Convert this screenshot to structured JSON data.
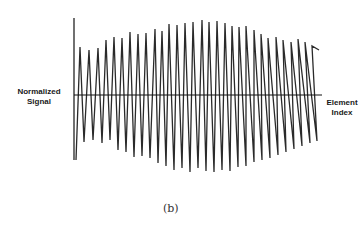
{
  "chart_data": {
    "type": "line",
    "title": "",
    "xlabel": "Element Index",
    "ylabel": "Normalized Signal",
    "caption": "(b)",
    "grid": false,
    "legend": null,
    "axis_origin_px": {
      "x": 74,
      "y": 95
    },
    "peaks_px": [
      [
        80,
        47
      ],
      [
        89,
        50
      ],
      [
        98,
        48
      ],
      [
        106,
        40
      ],
      [
        114,
        37
      ],
      [
        122,
        38
      ],
      [
        130,
        32
      ],
      [
        138,
        34
      ],
      [
        146,
        33
      ],
      [
        155,
        29
      ],
      [
        162,
        31
      ],
      [
        169,
        24
      ],
      [
        177,
        25
      ],
      [
        185,
        23
      ],
      [
        193,
        22
      ],
      [
        202,
        20
      ],
      [
        209,
        22
      ],
      [
        217,
        21
      ],
      [
        225,
        23
      ],
      [
        232,
        26
      ],
      [
        239,
        27
      ],
      [
        246,
        26
      ],
      [
        254,
        30
      ],
      [
        261,
        34
      ],
      [
        268,
        38
      ],
      [
        276,
        37
      ],
      [
        283,
        40
      ],
      [
        291,
        42
      ],
      [
        298,
        39
      ],
      [
        305,
        42
      ],
      [
        312,
        46
      ],
      [
        319,
        50
      ]
    ],
    "troughs_px": [
      [
        76,
        160
      ],
      [
        84,
        142
      ],
      [
        93,
        140
      ],
      [
        102,
        143
      ],
      [
        110,
        140
      ],
      [
        118,
        150
      ],
      [
        126,
        152
      ],
      [
        134,
        157
      ],
      [
        142,
        156
      ],
      [
        150,
        158
      ],
      [
        158,
        163
      ],
      [
        166,
        166
      ],
      [
        174,
        170
      ],
      [
        182,
        168
      ],
      [
        190,
        172
      ],
      [
        198,
        168
      ],
      [
        206,
        171
      ],
      [
        214,
        172
      ],
      [
        222,
        170
      ],
      [
        230,
        171
      ],
      [
        238,
        167
      ],
      [
        246,
        166
      ],
      [
        254,
        162
      ],
      [
        262,
        160
      ],
      [
        270,
        158
      ],
      [
        278,
        155
      ],
      [
        286,
        152
      ],
      [
        294,
        149
      ],
      [
        302,
        146
      ],
      [
        310,
        143
      ],
      [
        317,
        141
      ]
    ],
    "normalized_peaks": [
      0.6,
      0.57,
      0.59,
      0.71,
      0.75,
      0.74,
      0.82,
      0.79,
      0.8,
      0.86,
      0.83,
      0.93,
      0.91,
      0.95,
      0.96,
      1.0,
      0.96,
      0.98,
      0.95,
      0.91,
      0.9,
      0.91,
      0.86,
      0.8,
      0.75,
      0.76,
      0.72,
      0.69,
      0.73,
      0.69,
      0.64,
      0.58
    ],
    "ylim": [
      -1,
      1
    ]
  },
  "labels": {
    "y_axis_line1": "Normalized",
    "y_axis_line2": "Signal",
    "x_axis_line1": "Element",
    "x_axis_line2": "Index",
    "caption": "(b)"
  },
  "colors": {
    "signal": "#2a2a2a",
    "axis": "#111111"
  }
}
